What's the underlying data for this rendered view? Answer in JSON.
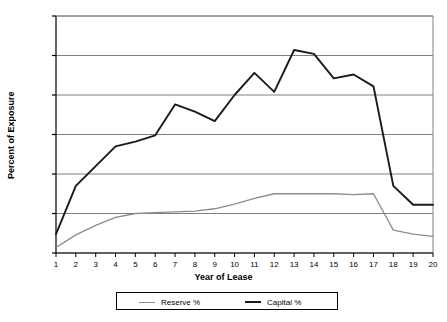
{
  "chart_data": {
    "type": "line",
    "title": "",
    "xlabel": "Year of Lease",
    "ylabel": "Percent of Exposure",
    "x": [
      1,
      2,
      3,
      4,
      5,
      6,
      7,
      8,
      9,
      10,
      11,
      12,
      13,
      14,
      15,
      16,
      17,
      18,
      19,
      20
    ],
    "categories": [
      "1",
      "2",
      "3",
      "4",
      "5",
      "6",
      "7",
      "8",
      "9",
      "10",
      "11",
      "12",
      "13",
      "14",
      "15",
      "16",
      "17",
      "18",
      "19",
      "20"
    ],
    "xlim": [
      1,
      20
    ],
    "ylim": [
      0.0,
      3.0
    ],
    "ytick_labels": [
      "0.0%",
      "0.5%",
      "1.0%",
      "1.5%",
      "2.0%",
      "2.5%",
      "3.0%"
    ],
    "ytick_values": [
      0.0,
      0.5,
      1.0,
      1.5,
      2.0,
      2.5,
      3.0
    ],
    "grid": "horizontal",
    "legend_position": "bottom",
    "series": [
      {
        "name": "Reserve %",
        "color": "#8c8c8c",
        "values": [
          0.07,
          0.23,
          0.35,
          0.45,
          0.5,
          0.51,
          0.52,
          0.53,
          0.56,
          0.62,
          0.69,
          0.75,
          0.75,
          0.75,
          0.75,
          0.74,
          0.75,
          0.29,
          0.24,
          0.21
        ]
      },
      {
        "name": "Capital %",
        "color": "#1a1a1a",
        "values": [
          0.24,
          0.85,
          1.1,
          1.35,
          1.41,
          1.49,
          1.88,
          1.79,
          1.67,
          2.0,
          2.28,
          2.04,
          2.57,
          2.52,
          2.21,
          2.26,
          2.11,
          0.85,
          0.61,
          0.61
        ]
      }
    ]
  },
  "legend": {
    "items": [
      {
        "label": "Reserve %",
        "color": "#8c8c8c"
      },
      {
        "label": "Capital %",
        "color": "#1a1a1a"
      }
    ]
  },
  "axes": {
    "x_title": "Year of Lease",
    "y_title": "Percent of Exposure"
  },
  "style": {
    "plot_background": "#ffffff",
    "grid_color": "#808080",
    "axis_color": "#000000"
  }
}
